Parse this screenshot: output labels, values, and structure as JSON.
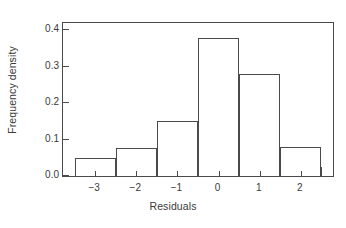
{
  "chart_data": {
    "type": "bar",
    "title": "",
    "subtitle": "",
    "xlabel": "Residuals",
    "ylabel": "Frequency density",
    "grid": false,
    "legend": null,
    "bin_width": 1,
    "bin_edges": [
      -3.5,
      -2.5,
      -1.5,
      -0.5,
      0.5,
      1.5,
      2.5
    ],
    "bin_centers": [
      -3,
      -2,
      -1,
      0,
      1,
      2
    ],
    "categories": [
      "-3",
      "-2",
      "-1",
      "0",
      "1",
      "2"
    ],
    "values": [
      0.05,
      0.077,
      0.152,
      0.38,
      0.28,
      0.08
    ],
    "xlim": [
      -3.78,
      2.78
    ],
    "ylim": [
      0.0,
      0.42
    ],
    "xticks_major": [
      -3.5,
      -2.5,
      -1.5,
      -0.5,
      0.5,
      1.5,
      2.5
    ],
    "xticks_minor": [
      -3,
      -2,
      -1,
      0,
      1,
      2
    ],
    "xtick_labels": [
      "−3",
      "−2",
      "−1",
      "0",
      "1",
      "2"
    ],
    "yticks": [
      0.0,
      0.1,
      0.2,
      0.3,
      0.4
    ],
    "ytick_labels": [
      "0.0",
      "0.1",
      "0.2",
      "0.3",
      "0.4"
    ],
    "bar_color": "none",
    "bar_edge_color": "#4a4a4a",
    "axis_color": "#4a4a4a",
    "text_color": "#3a3a3a",
    "background": "#ffffff"
  }
}
